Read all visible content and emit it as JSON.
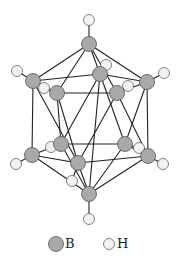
{
  "legend": {
    "items": [
      {
        "label": "B",
        "symbol": "boron-atom",
        "color": "#a9a9a9"
      },
      {
        "label": "H",
        "symbol": "hydrogen-atom",
        "color": "#f2f2f2"
      }
    ]
  },
  "atoms": {
    "boron": [
      {
        "id": "B1",
        "x": 89,
        "y": 44
      },
      {
        "id": "B2",
        "x": 33,
        "y": 81
      },
      {
        "id": "B3",
        "x": 57,
        "y": 93
      },
      {
        "id": "B4",
        "x": 100,
        "y": 74
      },
      {
        "id": "B5",
        "x": 117,
        "y": 93
      },
      {
        "id": "B6",
        "x": 147,
        "y": 82
      },
      {
        "id": "B7",
        "x": 32,
        "y": 155
      },
      {
        "id": "B8",
        "x": 61,
        "y": 144
      },
      {
        "id": "B9",
        "x": 78,
        "y": 163
      },
      {
        "id": "B10",
        "x": 125,
        "y": 144
      },
      {
        "id": "B11",
        "x": 148,
        "y": 156
      },
      {
        "id": "B12",
        "x": 89,
        "y": 194
      }
    ],
    "hydrogen": [
      {
        "id": "H1",
        "x": 89,
        "y": 20,
        "bonded_to": "B1"
      },
      {
        "id": "H2",
        "x": 17,
        "y": 71,
        "bonded_to": "B2"
      },
      {
        "id": "H3",
        "x": 44,
        "y": 88,
        "bonded_to": "B3"
      },
      {
        "id": "H4",
        "x": 106,
        "y": 65,
        "bonded_to": "B4"
      },
      {
        "id": "H5",
        "x": 128,
        "y": 86,
        "bonded_to": "B5"
      },
      {
        "id": "H6",
        "x": 164,
        "y": 73,
        "bonded_to": "B6"
      },
      {
        "id": "H7",
        "x": 16,
        "y": 164,
        "bonded_to": "B7"
      },
      {
        "id": "H8",
        "x": 51,
        "y": 147,
        "bonded_to": "B8"
      },
      {
        "id": "H9",
        "x": 72,
        "y": 181,
        "bonded_to": "B9"
      },
      {
        "id": "H10",
        "x": 139,
        "y": 148,
        "bonded_to": "B10"
      },
      {
        "id": "H11",
        "x": 163,
        "y": 164,
        "bonded_to": "B11"
      },
      {
        "id": "H12",
        "x": 89,
        "y": 219,
        "bonded_to": "B12"
      }
    ]
  },
  "bonds_bb": [
    [
      "B1",
      "B2"
    ],
    [
      "B1",
      "B3"
    ],
    [
      "B1",
      "B4"
    ],
    [
      "B1",
      "B5"
    ],
    [
      "B1",
      "B6"
    ],
    [
      "B2",
      "B3"
    ],
    [
      "B3",
      "B5"
    ],
    [
      "B5",
      "B6"
    ],
    [
      "B6",
      "B4"
    ],
    [
      "B4",
      "B2"
    ],
    [
      "B7",
      "B8"
    ],
    [
      "B8",
      "B10"
    ],
    [
      "B10",
      "B11"
    ],
    [
      "B11",
      "B9"
    ],
    [
      "B9",
      "B7"
    ],
    [
      "B12",
      "B7"
    ],
    [
      "B12",
      "B8"
    ],
    [
      "B12",
      "B9"
    ],
    [
      "B12",
      "B10"
    ],
    [
      "B12",
      "B11"
    ],
    [
      "B2",
      "B7"
    ],
    [
      "B2",
      "B9"
    ],
    [
      "B3",
      "B9"
    ],
    [
      "B3",
      "B8"
    ],
    [
      "B4",
      "B8"
    ],
    [
      "B4",
      "B10"
    ],
    [
      "B5",
      "B9"
    ],
    [
      "B5",
      "B11"
    ],
    [
      "B6",
      "B11"
    ],
    [
      "B6",
      "B10"
    ],
    [
      "B4",
      "B12"
    ]
  ]
}
